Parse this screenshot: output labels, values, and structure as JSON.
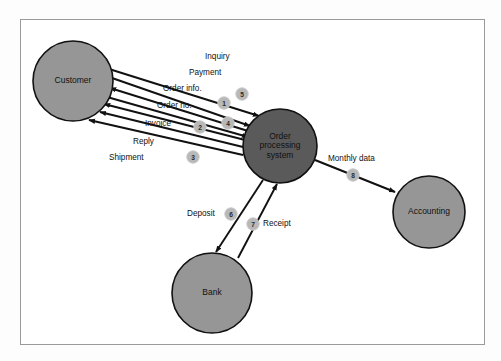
{
  "diagram": {
    "frame": {
      "x": 20,
      "y": 19,
      "width": 465,
      "height": 326,
      "border_color": "#9a9a9a",
      "fill": "#ffffff"
    },
    "colors": {
      "external_entity_fill": "#969696",
      "process_fill": "#5a5a5a",
      "node_stroke": "#111111",
      "badge_fill": "#b8b8b8",
      "badge_text": "#2b2b2b",
      "line": "#111111",
      "label_text": "#111111",
      "page_background": "#fdfdfd"
    },
    "nodes": [
      {
        "id": "customer",
        "label": "Customer",
        "cx": 73,
        "cy": 81,
        "r": 40,
        "kind": "external-entity",
        "fill": "#969696",
        "lines": [
          "Customer"
        ]
      },
      {
        "id": "order",
        "label": "Order processing system",
        "cx": 280,
        "cy": 146,
        "r": 37,
        "kind": "process",
        "fill": "#5a5a5a",
        "lines": [
          "Order",
          "processing",
          "system"
        ]
      },
      {
        "id": "accounting",
        "label": "Accounting",
        "cx": 429,
        "cy": 212,
        "r": 36,
        "kind": "external-entity",
        "fill": "#969696",
        "lines": [
          "Accounting"
        ]
      },
      {
        "id": "bank",
        "label": "Bank",
        "cx": 212,
        "cy": 293,
        "r": 40,
        "kind": "external-entity",
        "fill": "#969696",
        "lines": [
          "Bank"
        ]
      }
    ],
    "flows": [
      {
        "id": "inquiry",
        "label": "Inquiry",
        "badge": "5",
        "from": "customer",
        "to": "order",
        "label_x": 205,
        "label_y": 57,
        "anchor": "start",
        "badge_cx": 242,
        "badge_cy": 94
      },
      {
        "id": "payment",
        "label": "Payment",
        "badge": "1",
        "from": "customer",
        "to": "order",
        "label_x": 189,
        "label_y": 73,
        "anchor": "start",
        "badge_cx": 224,
        "badge_cy": 103
      },
      {
        "id": "order-info",
        "label": "Order info.",
        "badge": "4",
        "from": "order",
        "to": "customer",
        "label_x": 163,
        "label_y": 89,
        "anchor": "start",
        "badge_cx": 228,
        "badge_cy": 123
      },
      {
        "id": "order-no",
        "label": "Order no.",
        "badge": "",
        "from": "customer",
        "to": "order",
        "label_x": 157,
        "label_y": 106,
        "anchor": "start",
        "badge_cx": 0,
        "badge_cy": 0
      },
      {
        "id": "invoice",
        "label": "Invoice",
        "badge": "2",
        "from": "order",
        "to": "customer",
        "label_x": 145,
        "label_y": 124,
        "anchor": "start",
        "badge_cx": 200,
        "badge_cy": 127
      },
      {
        "id": "reply",
        "label": "Reply",
        "badge": "",
        "from": "order",
        "to": "customer",
        "label_x": 133,
        "label_y": 142,
        "anchor": "start",
        "badge_cx": 0,
        "badge_cy": 0
      },
      {
        "id": "shipment",
        "label": "Shipment",
        "badge": "3",
        "from": "order",
        "to": "customer",
        "label_x": 109,
        "label_y": 158,
        "anchor": "start",
        "badge_cx": 193,
        "badge_cy": 157
      },
      {
        "id": "monthly-data",
        "label": "Monthly data",
        "badge": "8",
        "from": "order",
        "to": "accounting",
        "label_x": 328,
        "label_y": 159,
        "anchor": "start",
        "badge_cx": 353,
        "badge_cy": 175
      },
      {
        "id": "deposit",
        "label": "Deposit",
        "badge": "6",
        "from": "order",
        "to": "bank",
        "label_x": 187,
        "label_y": 214,
        "anchor": "start",
        "badge_cx": 231,
        "badge_cy": 214
      },
      {
        "id": "receipt",
        "label": "Receipt",
        "badge": "7",
        "from": "bank",
        "to": "order",
        "label_x": 263,
        "label_y": 224,
        "anchor": "start",
        "badge_cx": 253,
        "badge_cy": 224
      }
    ],
    "edge_geometry": [
      {
        "id": "inquiry",
        "x1": 109,
        "y1": 69,
        "x2": 259,
        "y2": 116,
        "arrow_at_end": true
      },
      {
        "id": "payment",
        "x1": 112,
        "y1": 78,
        "x2": 250,
        "y2": 126,
        "arrow_at_end": true
      },
      {
        "id": "order-info",
        "x1": 248,
        "y1": 131,
        "x2": 110,
        "y2": 88,
        "arrow_at_end": true
      },
      {
        "id": "order-no",
        "x1": 107,
        "y1": 97,
        "x2": 248,
        "y2": 137,
        "arrow_at_end": true
      },
      {
        "id": "invoice",
        "x1": 245,
        "y1": 140,
        "x2": 104,
        "y2": 104,
        "arrow_at_end": true
      },
      {
        "id": "reply",
        "x1": 243,
        "y1": 147,
        "x2": 100,
        "y2": 112,
        "arrow_at_end": true
      },
      {
        "id": "shipment",
        "x1": 243,
        "y1": 155,
        "x2": 89,
        "y2": 120,
        "arrow_at_end": true
      },
      {
        "id": "monthly-data",
        "x1": 315,
        "y1": 160,
        "x2": 395,
        "y2": 192,
        "arrow_at_end": true
      },
      {
        "id": "deposit",
        "x1": 263,
        "y1": 180,
        "x2": 216,
        "y2": 252,
        "arrow_at_end": true
      },
      {
        "id": "receipt",
        "x1": 238,
        "y1": 258,
        "x2": 277,
        "y2": 184,
        "arrow_at_end": true
      }
    ]
  }
}
